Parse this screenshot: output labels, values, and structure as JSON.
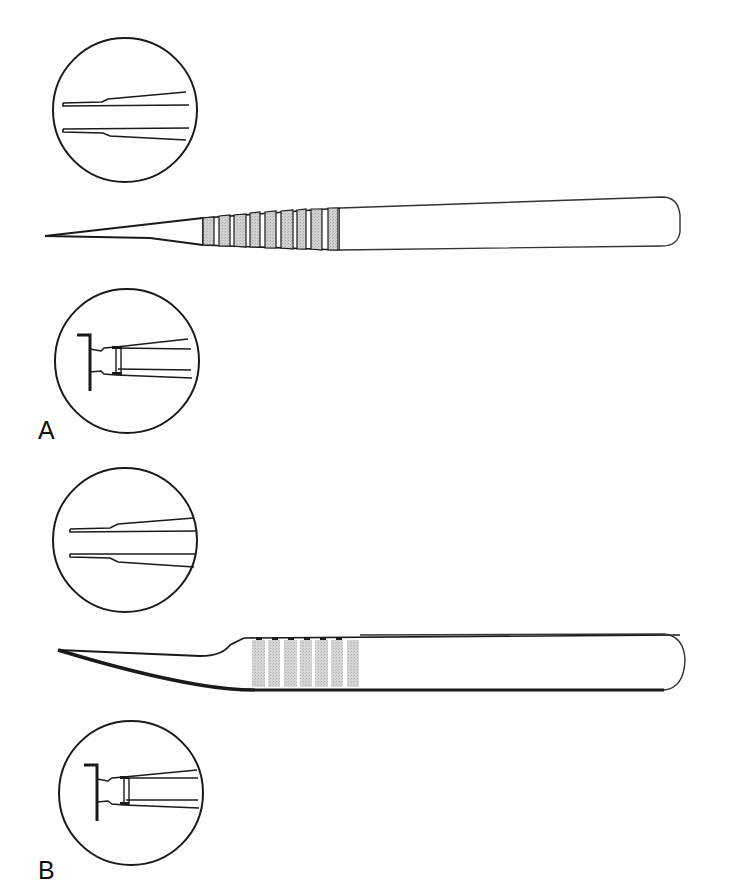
{
  "figure": {
    "panels": [
      {
        "label": "A",
        "instrument": "straight-forceps",
        "detail_views": [
          "tip-closeup",
          "hinge-closeup"
        ]
      },
      {
        "label": "B",
        "instrument": "curved-forceps",
        "detail_views": [
          "tip-closeup",
          "hinge-closeup"
        ]
      }
    ],
    "colors": {
      "line": "#1a1a1a",
      "grip_shade": "#c8c8c8",
      "background": "#ffffff"
    }
  }
}
